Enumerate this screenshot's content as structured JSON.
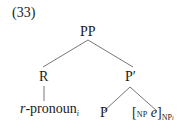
{
  "example_number": "(33)",
  "tree": {
    "root": {
      "label": "PP"
    },
    "left": {
      "label": "R",
      "child": {
        "text": "r",
        "hyphen_word": "-pronoun",
        "index": "i"
      }
    },
    "right": {
      "label": "P",
      "bar": "′",
      "children": [
        {
          "label": "P"
        },
        {
          "open": "[",
          "open_sub": "NP",
          "content": "e",
          "close": "]",
          "close_sub": "NP",
          "close_index": "i"
        }
      ]
    }
  },
  "colors": {
    "text": "#1a1a1a",
    "lines": "#777777"
  }
}
